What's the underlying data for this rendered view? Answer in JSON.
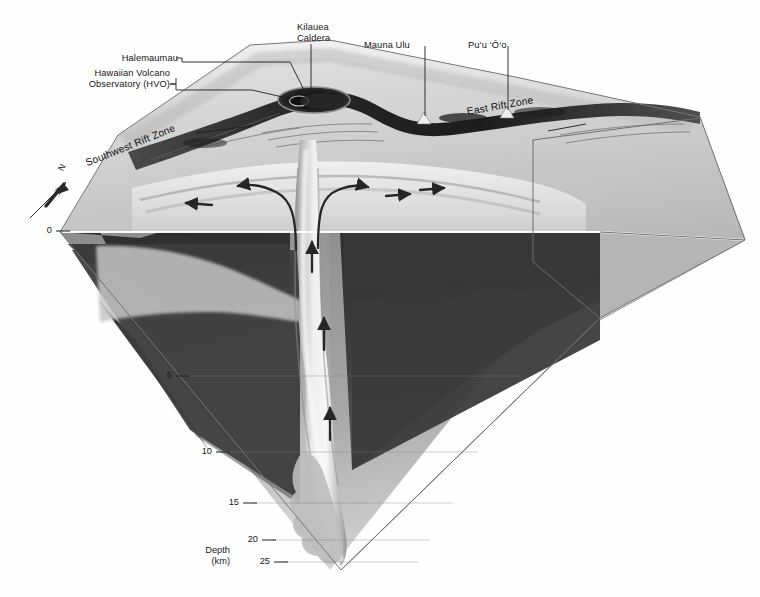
{
  "figure": {
    "top_scan_artifact": "· · ·· · ·· ··· ·· · ·· ·· ··· ·",
    "orientation": {
      "arrow_label": "N",
      "icon": "north-arrow-icon"
    }
  },
  "labels": {
    "halemaumau": "Halemaumau",
    "hvo_line1": "Hawaiian Volcano",
    "hvo_line2": "Observatory (HVO)",
    "kilauea_line1": "Kilauea",
    "kilauea_line2": "Caldera",
    "mauna_ulu": "Mauna Ulu",
    "puu_oo": "Pu‘u ‘Ō‘o",
    "east_rift": "East Rift Zone",
    "southwest_rift": "Southwest Rift Zone"
  },
  "depth_axis": {
    "caption_line1": "Depth",
    "caption_line2": "(km)",
    "unit": "km",
    "ticks": [
      {
        "value": "0",
        "y": 231
      },
      {
        "value": "5",
        "y": 376
      },
      {
        "value": "10",
        "y": 452
      },
      {
        "value": "15",
        "y": 503
      },
      {
        "value": "20",
        "y": 540
      },
      {
        "value": "25",
        "y": 562
      }
    ]
  },
  "flow_arrows": {
    "shallow_left": "magma flow southwest along rift",
    "shallow_right": "magma flow east along rift",
    "conduit_up": "magma rising through central conduit"
  },
  "colors": {
    "page_bg": "#ffffff",
    "surface_light": "#d9d9d9",
    "surface_mid": "#b9b9b9",
    "surface_dark": "#8f8f8f",
    "crust_dark": "#3b3b3b",
    "crust_deep": "#6e6e6e",
    "mantle_light": "#c9c9c9",
    "conduit": "#e6e6e6",
    "line": "#2a2a2a",
    "rift_dark": "#2b2b2b"
  }
}
